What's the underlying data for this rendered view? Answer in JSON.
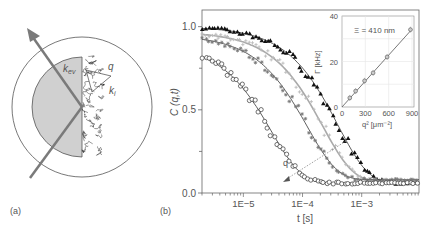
{
  "panel_a": {
    "label": "(a)",
    "symbols": {
      "k_ev": "k",
      "k_ev_sub": "ev",
      "q": "q",
      "k_i": "k",
      "k_i_sub": "i"
    },
    "colors": {
      "prism_fill": "#d0d0d0",
      "arrow": "#7a7a7a",
      "outline": "#555555"
    }
  },
  "panel_b": {
    "label": "(b)",
    "q_arrow_label": "q"
  },
  "chart_data": [
    {
      "id": "main",
      "type": "scatter",
      "title": "",
      "xlabel": "t [s]",
      "ylabel": "C (q,t)",
      "xscale": "log",
      "xlim": [
        2e-06,
        0.0093
      ],
      "ylim": [
        0.0,
        1.1
      ],
      "xticks": [
        1e-05,
        0.0001,
        0.001
      ],
      "xtick_labels": [
        "1E−5",
        "1E−4",
        "1E−3"
      ],
      "yticks": [
        0.0,
        0.5,
        1.0
      ],
      "ytick_labels": [
        "0.0",
        "0.5",
        "1.0"
      ],
      "grid": false,
      "annotations": [
        {
          "text": "q",
          "note": "dotted arrow pointing toward increasing q"
        }
      ],
      "series": [
        {
          "name": "q1 (smallest q)",
          "marker": "filled-triangle",
          "color": "#111111",
          "tau": 0.0004,
          "amp": 1.0,
          "baseline": 0.06
        },
        {
          "name": "q2",
          "marker": "light-cross",
          "color": "#bbbbbb",
          "tau": 0.00022,
          "amp": 0.97,
          "baseline": 0.07
        },
        {
          "name": "q3",
          "marker": "star",
          "color": "#777777",
          "tau": 0.00012,
          "amp": 0.95,
          "baseline": 0.08
        },
        {
          "name": "q4 (largest q)",
          "marker": "open-circle",
          "color": "#333333",
          "tau": 3e-05,
          "amp": 0.9,
          "baseline": 0.06
        }
      ]
    },
    {
      "id": "inset",
      "type": "scatter",
      "xlabel": "q² [μm⁻²]",
      "ylabel": "Γ [kHz]",
      "xlim": [
        0,
        900
      ],
      "ylim": [
        0,
        40
      ],
      "xticks": [
        0,
        300,
        600,
        900
      ],
      "xtick_labels": [
        "0",
        "300",
        "600",
        "900"
      ],
      "yticks": [
        0,
        20,
        40
      ],
      "ytick_labels": [
        "0",
        "20",
        "40"
      ],
      "grid": true,
      "annotation": "Ξ = 410 nm",
      "fit_line": {
        "slope": 0.038,
        "intercept": 0
      },
      "points": [
        {
          "x": 100,
          "y": 4
        },
        {
          "x": 175,
          "y": 7
        },
        {
          "x": 290,
          "y": 11.5
        },
        {
          "x": 400,
          "y": 15
        },
        {
          "x": 580,
          "y": 22
        },
        {
          "x": 880,
          "y": 34
        }
      ]
    }
  ]
}
